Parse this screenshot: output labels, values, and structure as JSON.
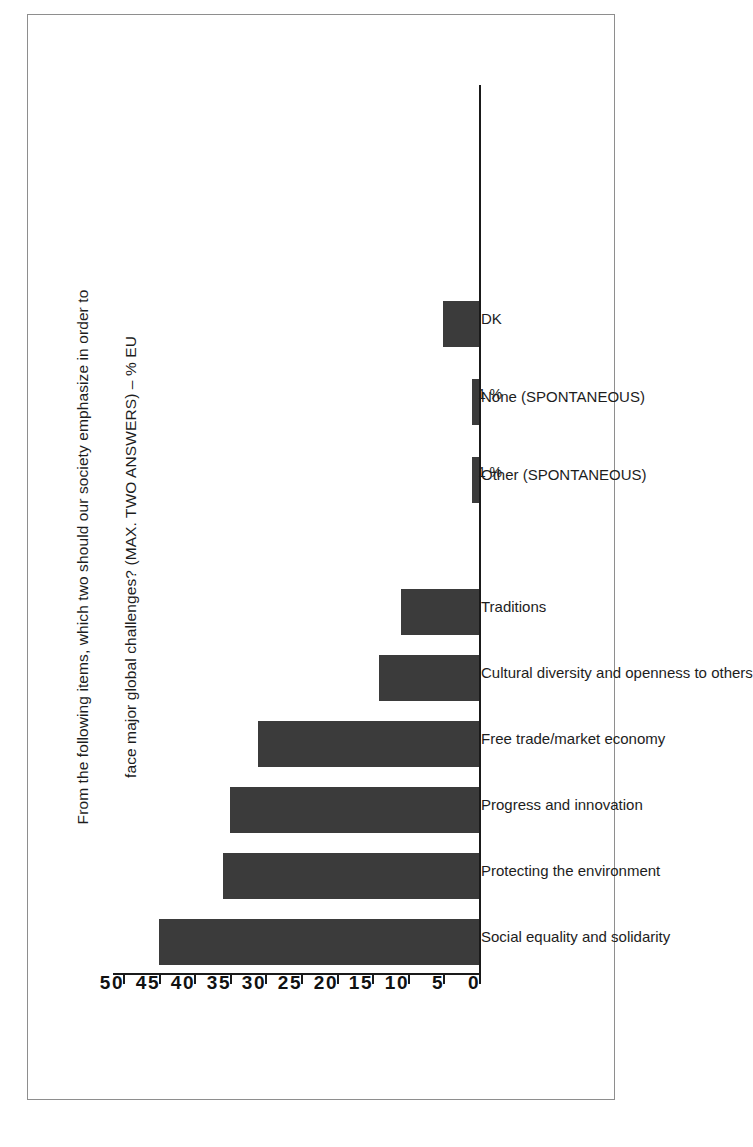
{
  "figure": {
    "title_line1": "From the following items, which two should our society emphasize in order to",
    "title_line2": "face major global challenges? (MAX. TWO ANSWERS) – % EU",
    "bar_color": "#3b3b3b",
    "frame_color": "#8e8e8e",
    "axis_color": "#1a1a1a"
  },
  "chart_data": {
    "type": "bar",
    "title": "From the following items, which two should our society emphasize in order to face major global challenges? (MAX. TWO ANSWERS) – % EU",
    "xlabel": "",
    "ylabel": "",
    "ylim": [
      0,
      50
    ],
    "grid": false,
    "legend": false,
    "orientation": "vertical-bars-on-rotated-page",
    "categories": [
      "Social equality and solidarity",
      "Protecting the environment",
      "Progress and innovation",
      "Free trade/market economy",
      "Cultural diversity and openness to others",
      "Traditions",
      "Other (SPONTANEOUS)",
      "None (SPONTANEOUS)",
      "DK"
    ],
    "values": [
      45,
      36,
      35,
      31,
      14,
      11,
      1,
      1,
      5
    ],
    "data_labels": [
      "",
      "",
      "",
      "",
      "",
      "",
      "1 %",
      "1 %",
      ""
    ],
    "ticks": [
      0,
      5,
      10,
      15,
      20,
      25,
      30,
      35,
      40,
      45,
      50
    ],
    "tick_labels": [
      "0",
      "5",
      "10",
      "15",
      "20",
      "25",
      "30",
      "35",
      "40",
      "45",
      "50"
    ]
  }
}
